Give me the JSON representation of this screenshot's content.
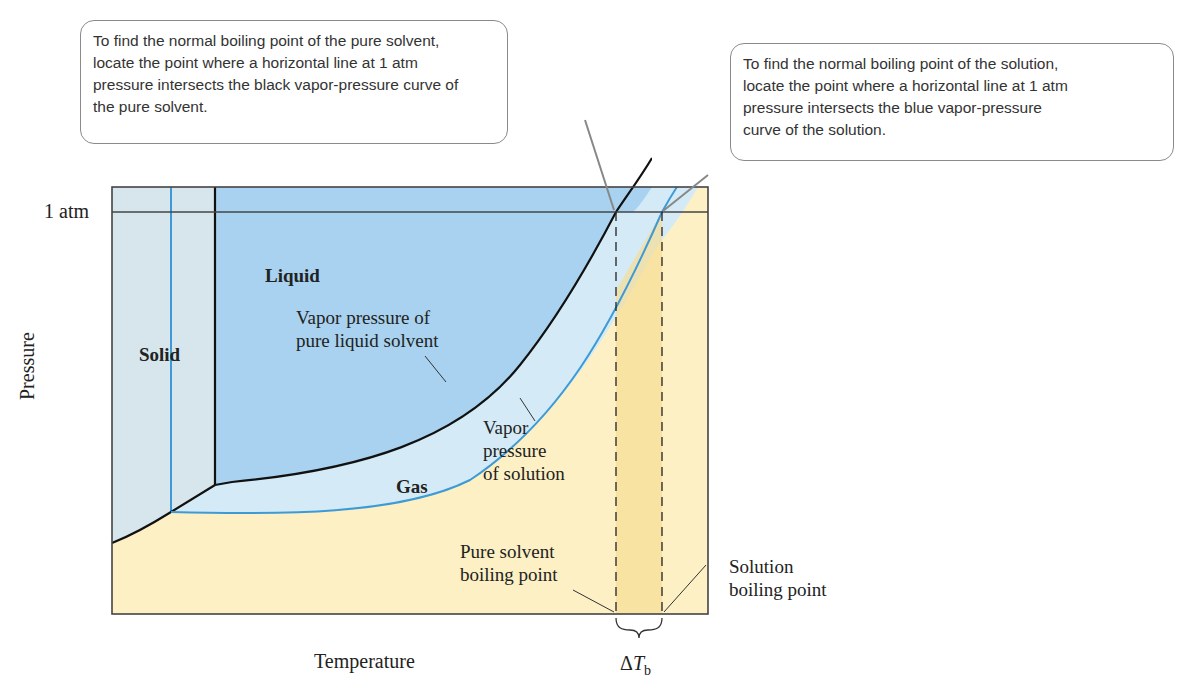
{
  "callouts": {
    "pure_solvent": {
      "lines": [
        "To find the normal boiling point of the pure solvent,",
        "locate the point where a horizontal line at 1 atm",
        "pressure intersects the black vapor-pressure curve of",
        "the pure solvent."
      ]
    },
    "solution": {
      "lines": [
        "To find the normal boiling point of the solution,",
        "locate the point where a horizontal line at 1 atm",
        "pressure intersects the blue vapor-pressure",
        "curve of the solution."
      ]
    }
  },
  "axes": {
    "y_label": "Pressure",
    "x_label": "Temperature",
    "y_tick": "1 atm"
  },
  "regions": {
    "solid": "Solid",
    "liquid": "Liquid",
    "gas": "Gas"
  },
  "curve_labels": {
    "pure_vp": [
      "Vapor pressure of",
      "pure liquid solvent"
    ],
    "solution_vp": [
      "Vapor",
      "pressure",
      "of solution"
    ]
  },
  "points": {
    "pure_bp": [
      "Pure solvent",
      "boiling point"
    ],
    "solution_bp": [
      "Solution",
      "boiling point"
    ],
    "delta": "ΔT",
    "delta_sub": "b"
  },
  "colors": {
    "solid_region": "#d6e6ec",
    "liquid_region": "#a8d2ef",
    "gas_region": "#fcf0c4",
    "band": "#d4ebf7",
    "delta_band": "#f6dd96",
    "blue_curve": "#3d9ad6",
    "black_curve": "#111111"
  }
}
